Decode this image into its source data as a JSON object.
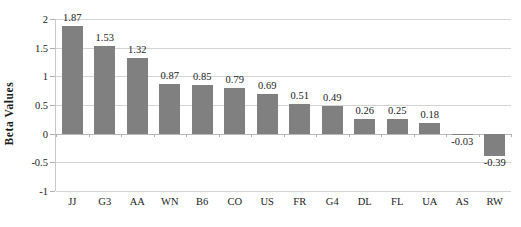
{
  "chart_data": {
    "type": "bar",
    "title": "",
    "subtitle": "",
    "xlabel": "",
    "ylabel": "Beta Values",
    "categories": [
      "JJ",
      "G3",
      "AA",
      "WN",
      "B6",
      "CO",
      "US",
      "FR",
      "G4",
      "DL",
      "FL",
      "UA",
      "AS",
      "RW"
    ],
    "values": [
      1.87,
      1.53,
      1.32,
      0.87,
      0.85,
      0.79,
      0.69,
      0.51,
      0.49,
      0.26,
      0.25,
      0.18,
      -0.03,
      -0.39
    ],
    "data_labels": [
      "1.87",
      "1.53",
      "1.32",
      "0.87",
      "0.85",
      "0.79",
      "0.69",
      "0.51",
      "0.49",
      "0.26",
      "0.25",
      "0.18",
      "-0.03",
      "-0.39"
    ],
    "ylim": [
      -1,
      2
    ],
    "ytick_values": [
      2,
      1.5,
      1,
      0.5,
      0,
      -0.5,
      -1
    ],
    "ytick_labels": [
      "2",
      "1.5",
      "1",
      "0.5",
      "0",
      "-0.5",
      "-1"
    ],
    "grid": true,
    "grid_axis": "y",
    "legend": false,
    "legend_position": "none",
    "bar_color": "#808080",
    "gridline_color": "#d4d4d4",
    "axis_color": "#c9c9c9",
    "text_color": "#1b1b1b",
    "background_color": "#ffffff",
    "show_data_labels": true,
    "series": [
      {
        "name": "Beta Values",
        "values": [
          1.87,
          1.53,
          1.32,
          0.87,
          0.85,
          0.79,
          0.69,
          0.51,
          0.49,
          0.26,
          0.25,
          0.18,
          -0.03,
          -0.39
        ]
      }
    ]
  }
}
